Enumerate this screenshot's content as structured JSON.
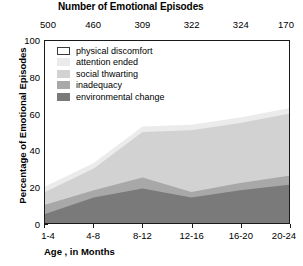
{
  "top_title": "Number of Emotional Episodes",
  "axis": {
    "ylabel": "Percentage of Emotional Episodes",
    "xlabel": "Age , in Months",
    "yticks": [
      "0",
      "20",
      "40",
      "60",
      "80",
      "100"
    ],
    "ylim": [
      0,
      100
    ]
  },
  "legend": [
    {
      "label": "physical discomfort",
      "color": "#ffffff",
      "outlined": true
    },
    {
      "label": "attention ended",
      "color": "#ebebeb",
      "outlined": false
    },
    {
      "label": "social thwarting",
      "color": "#d2d2d2",
      "outlined": false
    },
    {
      "label": "inadequacy",
      "color": "#a8a8a8",
      "outlined": false
    },
    {
      "label": "environmental change",
      "color": "#7a7a7a",
      "outlined": false
    }
  ],
  "episode_counts": [
    "500",
    "460",
    "309",
    "322",
    "324",
    "170"
  ],
  "xticks": [
    "1-4",
    "4-8",
    "8-12",
    "12-16",
    "16-20",
    "20-24"
  ],
  "chart_data": {
    "type": "area",
    "title": "Number of Emotional Episodes",
    "xlabel": "Age , in Months",
    "ylabel": "Percentage of Emotional Episodes",
    "ylim": [
      0,
      100
    ],
    "grid": false,
    "legend_position": "inside-top-left",
    "stacked": true,
    "stack_order_bottom_to_top": [
      "environmental change",
      "inadequacy",
      "social thwarting",
      "attention ended",
      "physical discomfort"
    ],
    "categories": [
      "1-4",
      "4-8",
      "8-12",
      "12-16",
      "16-20",
      "20-24"
    ],
    "episode_counts": [
      500,
      460,
      309,
      322,
      324,
      170
    ],
    "series": [
      {
        "name": "environmental change",
        "color": "#7a7a7a",
        "values": [
          5,
          14,
          19,
          14,
          18,
          21
        ]
      },
      {
        "name": "inadequacy",
        "color": "#a8a8a8",
        "values": [
          5,
          4,
          6,
          3,
          4,
          5
        ]
      },
      {
        "name": "social thwarting",
        "color": "#d2d2d2",
        "values": [
          7,
          12,
          25,
          34,
          33,
          34
        ]
      },
      {
        "name": "attention ended",
        "color": "#ebebeb",
        "values": [
          3,
          3,
          3,
          3,
          3,
          3
        ]
      },
      {
        "name": "physical discomfort",
        "color": "#ffffff",
        "values": [
          80,
          67,
          47,
          46,
          42,
          37
        ]
      }
    ],
    "cumulative_boundaries": {
      "environmental change": [
        5,
        14,
        19,
        14,
        18,
        21
      ],
      "inadequacy": [
        10,
        18,
        25,
        17,
        22,
        26
      ],
      "social thwarting": [
        17,
        30,
        50,
        51,
        55,
        60
      ],
      "attention ended": [
        20,
        33,
        53,
        54,
        58,
        63
      ],
      "physical discomfort": [
        100,
        100,
        100,
        100,
        100,
        100
      ]
    }
  }
}
